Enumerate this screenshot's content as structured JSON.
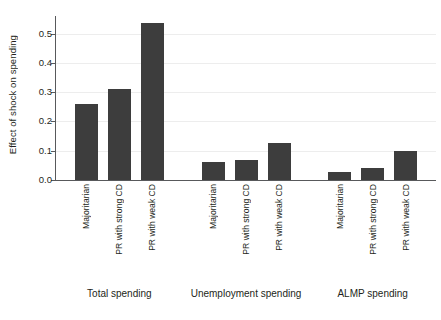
{
  "chart_data": {
    "type": "bar",
    "title": "",
    "xlabel": "",
    "ylabel": "Effect of shock on spending",
    "ylim": [
      0.0,
      0.56
    ],
    "grid": true,
    "legend": false,
    "yticks": [
      "0.0",
      "0.1",
      "0.2",
      "0.3",
      "0.4",
      "0.5"
    ],
    "ytick_values": [
      0.0,
      0.1,
      0.2,
      0.3,
      0.4,
      0.5
    ],
    "bar_color": "#3d3d3d",
    "categories": [
      "Majoritarian",
      "PR with strong CD",
      "PR with weak CD"
    ],
    "groups": [
      {
        "label": "Total spending",
        "bars": [
          {
            "category": "Majoritarian",
            "value": 0.26
          },
          {
            "category": "PR with strong CD",
            "value": 0.31
          },
          {
            "category": "PR with weak CD",
            "value": 0.535
          }
        ]
      },
      {
        "label": "Unemployment spending",
        "bars": [
          {
            "category": "Majoritarian",
            "value": 0.06
          },
          {
            "category": "PR with strong CD",
            "value": 0.07
          },
          {
            "category": "PR with weak CD",
            "value": 0.125
          }
        ]
      },
      {
        "label": "ALMP spending",
        "bars": [
          {
            "category": "Majoritarian",
            "value": 0.027
          },
          {
            "category": "PR with strong CD",
            "value": 0.04
          },
          {
            "category": "PR with weak CD",
            "value": 0.1
          }
        ]
      }
    ]
  }
}
